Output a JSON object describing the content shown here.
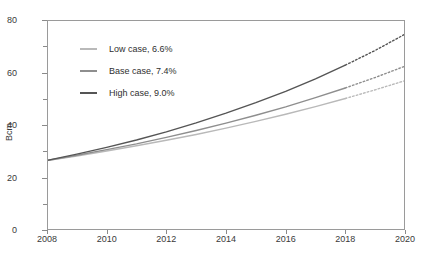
{
  "chart_data": {
    "type": "line",
    "title": "",
    "xlabel": "",
    "ylabel": "Bcm",
    "xlim": [
      2008,
      2020
    ],
    "ylim": [
      0,
      80
    ],
    "grid": false,
    "legend_position": "upper-left-inside",
    "x": [
      2008,
      2009,
      2010,
      2011,
      2012,
      2013,
      2014,
      2015,
      2016,
      2017,
      2018,
      2019,
      2020
    ],
    "x_ticks": [
      "2008",
      "2010",
      "2012",
      "2014",
      "2016",
      "2018",
      "2020"
    ],
    "y_ticks_major": [
      "0",
      "20",
      "40",
      "60",
      "80"
    ],
    "y_ticks_minor": [
      10,
      30,
      50,
      70
    ],
    "forecast_starts": 2018,
    "annotations": [
      "Solid lines are historical/estimated through 2018; dotted segments from 2018 to 2020 are projections."
    ],
    "series": [
      {
        "name": "Low case, 6.6%",
        "cagr": "6.6%",
        "color": "#b9b9b9",
        "values": [
          26.5,
          28.2,
          30.1,
          32.1,
          34.2,
          36.4,
          38.8,
          41.4,
          44.1,
          47.0,
          50.1,
          53.4,
          56.9
        ]
      },
      {
        "name": "Base case, 7.4%",
        "cagr": "7.4%",
        "color": "#8e8e8e",
        "values": [
          26.5,
          28.5,
          30.6,
          32.8,
          35.3,
          37.9,
          40.7,
          43.7,
          46.9,
          50.4,
          54.1,
          58.1,
          62.4
        ]
      },
      {
        "name": "High case, 9.0%",
        "cagr": "9.0%",
        "color": "#555555",
        "values": [
          26.5,
          28.9,
          31.5,
          34.3,
          37.4,
          40.8,
          44.5,
          48.5,
          52.8,
          57.6,
          62.8,
          68.4,
          74.6
        ]
      }
    ]
  },
  "legend": {
    "items": [
      {
        "label": "Low case, 6.6%"
      },
      {
        "label": "Base case, 7.4%"
      },
      {
        "label": "High case, 9.0%"
      }
    ]
  },
  "axes": {
    "y_axis_title": "Bcm"
  }
}
